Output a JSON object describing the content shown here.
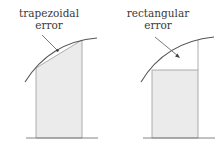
{
  "panels": [
    {
      "id": "trapezoidal",
      "label_line1": "trapezoidal",
      "label_line2": "error"
    },
    {
      "id": "rectangular",
      "label_line1": "rectangular",
      "label_line2": "error"
    }
  ],
  "colors": {
    "curve": "#555555",
    "fill": "#ebebeb",
    "outline": "#8a8a8a",
    "text": "#3a3a3a"
  }
}
